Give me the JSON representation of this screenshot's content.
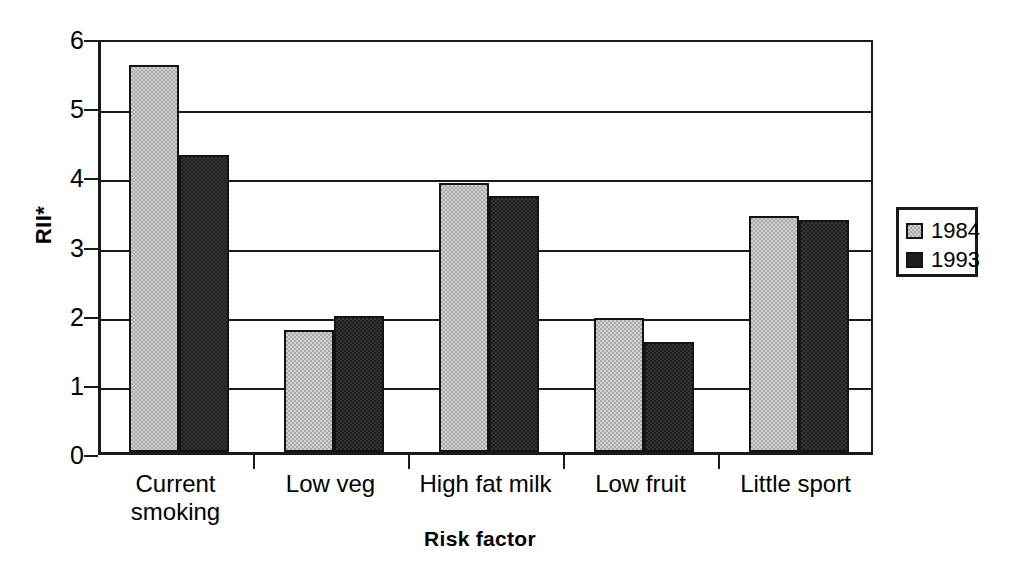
{
  "chart_data": {
    "type": "bar",
    "title": "",
    "xlabel": "Risk factor",
    "ylabel": "RII*",
    "categories": [
      "Current smoking",
      "Low veg",
      "High fat milk",
      "Low fruit",
      "Little sport"
    ],
    "category_lines": [
      [
        "Current",
        "smoking"
      ],
      [
        "Low veg"
      ],
      [
        "High fat milk"
      ],
      [
        "Low fruit"
      ],
      [
        "Little sport"
      ]
    ],
    "series": [
      {
        "name": "1984",
        "color": "#a9a9a9",
        "values": [
          5.6,
          1.77,
          3.89,
          1.94,
          3.41
        ]
      },
      {
        "name": "1993",
        "color": "#1f1f1f",
        "values": [
          4.3,
          1.97,
          3.7,
          1.59,
          3.35
        ]
      }
    ],
    "ylim": [
      0,
      6
    ],
    "ytick_labels": [
      "0",
      "1",
      "2",
      "3",
      "4",
      "5",
      "6"
    ],
    "ytick_values": [
      0,
      1,
      2,
      3,
      4,
      5,
      6
    ],
    "grid": true,
    "legend_position": "right"
  },
  "legend": {
    "entries": [
      {
        "label": "1984"
      },
      {
        "label": "1993"
      }
    ]
  },
  "axes": {
    "y_title": "RII*",
    "x_title": "Risk factor"
  }
}
